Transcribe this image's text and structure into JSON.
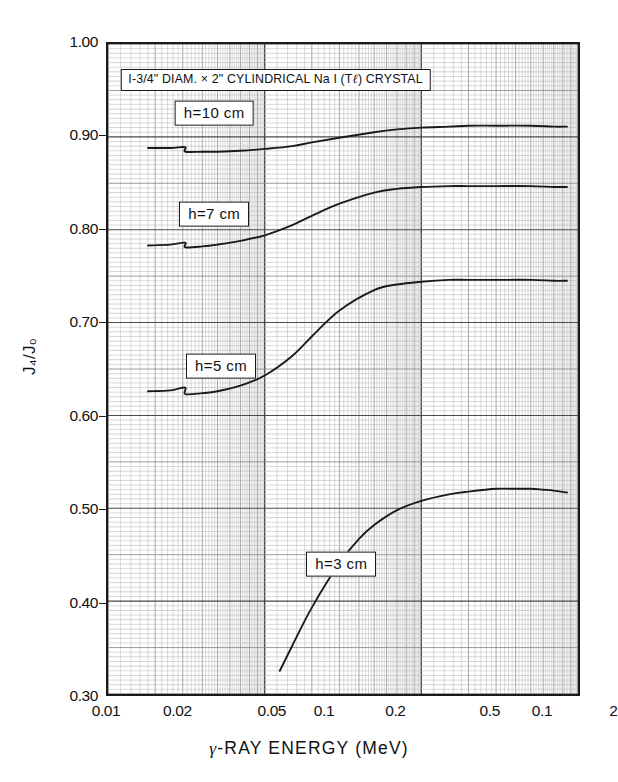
{
  "figure": {
    "title_box": "I-3/4\" DIAM. × 2\" CYLINDRICAL  Na I (Tℓ) CRYSTAL",
    "background_color": "#ffffff",
    "ink_color": "#1a1a1a",
    "grid_color": "#8d8d8d"
  },
  "axes": {
    "y_label": "J₄/J₀",
    "x_label_prefix": "γ",
    "x_label_rest": "-RAY ENERGY (MeV)",
    "y_ticks": [
      "1.00",
      "0.90",
      "0.80",
      "0.70",
      "0.60",
      "0.50",
      "0.40",
      "0.30"
    ],
    "y_tick_values": [
      1.0,
      0.9,
      0.8,
      0.7,
      0.6,
      0.5,
      0.4,
      0.3
    ],
    "x_ticks": [
      "0.01",
      "0.02",
      "0.05",
      "0.1",
      "0.2",
      "0.5",
      "0.1",
      "2",
      "5",
      "10"
    ],
    "x_tick_values": [
      0.01,
      0.02,
      0.05,
      0.1,
      0.2,
      0.5,
      1.0,
      2.0,
      5.0,
      10.0
    ]
  },
  "curve_labels": {
    "h10": "h=10 cm",
    "h7": "h=7 cm",
    "h5": "h=5 cm",
    "h3": "h=3 cm"
  },
  "chart_data": {
    "type": "line",
    "title": "I-3/4\" DIAM. × 2\" CYLINDRICAL  Na I (Tℓ) CRYSTAL",
    "xlabel": "γ-RAY ENERGY (MeV)",
    "ylabel": "J₄/J₀",
    "xscale": "log",
    "yscale": "linear",
    "xlim": [
      0.01,
      10
    ],
    "ylim": [
      0.3,
      1.0
    ],
    "grid": true,
    "grid_style": "log-log graph paper, minor decade subdivisions",
    "legend": "inline boxed labels on each curve",
    "series": [
      {
        "name": "h=10 cm",
        "label": "h=10 cm",
        "x": [
          0.018,
          0.025,
          0.031,
          0.0312,
          0.04,
          0.05,
          0.07,
          0.1,
          0.15,
          0.2,
          0.3,
          0.5,
          0.7,
          1.0,
          1.5,
          2.0,
          3.0,
          5.0,
          7.0,
          8.5
        ],
        "y": [
          0.888,
          0.888,
          0.889,
          0.884,
          0.884,
          0.884,
          0.885,
          0.887,
          0.89,
          0.894,
          0.899,
          0.905,
          0.908,
          0.91,
          0.911,
          0.912,
          0.912,
          0.912,
          0.911,
          0.911
        ]
      },
      {
        "name": "h=7 cm",
        "label": "h=7 cm",
        "x": [
          0.018,
          0.025,
          0.031,
          0.0312,
          0.04,
          0.05,
          0.07,
          0.1,
          0.15,
          0.2,
          0.3,
          0.5,
          0.7,
          1.0,
          1.5,
          2.0,
          3.0,
          5.0,
          7.0,
          8.5
        ],
        "y": [
          0.783,
          0.784,
          0.786,
          0.781,
          0.782,
          0.784,
          0.788,
          0.794,
          0.805,
          0.815,
          0.828,
          0.84,
          0.844,
          0.846,
          0.847,
          0.847,
          0.847,
          0.847,
          0.846,
          0.846
        ]
      },
      {
        "name": "h=5 cm",
        "label": "h=5 cm",
        "x": [
          0.018,
          0.025,
          0.031,
          0.0312,
          0.04,
          0.05,
          0.07,
          0.1,
          0.15,
          0.2,
          0.3,
          0.5,
          0.7,
          1.0,
          1.5,
          2.0,
          3.0,
          5.0,
          7.0,
          8.5
        ],
        "y": [
          0.626,
          0.627,
          0.63,
          0.623,
          0.624,
          0.626,
          0.632,
          0.643,
          0.664,
          0.685,
          0.713,
          0.735,
          0.741,
          0.744,
          0.746,
          0.746,
          0.746,
          0.746,
          0.745,
          0.745
        ]
      },
      {
        "name": "h=3 cm",
        "label": "h=3 cm",
        "x": [
          0.125,
          0.15,
          0.2,
          0.3,
          0.4,
          0.5,
          0.7,
          1.0,
          1.5,
          2.0,
          3.0,
          4.0,
          5.0,
          6.0,
          7.0,
          8.5
        ],
        "y": [
          0.325,
          0.352,
          0.393,
          0.441,
          0.467,
          0.482,
          0.498,
          0.508,
          0.515,
          0.518,
          0.521,
          0.521,
          0.521,
          0.52,
          0.519,
          0.517
        ]
      }
    ],
    "annotations": [
      {
        "text": "I-3/4\" DIAM. × 2\" CYLINDRICAL  Na I (Tℓ) CRYSTAL",
        "x": 0.115,
        "y": 0.962
      },
      {
        "text": "h=10 cm",
        "x": 0.047,
        "y": 0.926
      },
      {
        "text": "h=7 cm",
        "x": 0.047,
        "y": 0.818
      },
      {
        "text": "h=5 cm",
        "x": 0.052,
        "y": 0.655
      },
      {
        "text": "h=3 cm",
        "x": 0.3,
        "y": 0.443
      }
    ]
  }
}
